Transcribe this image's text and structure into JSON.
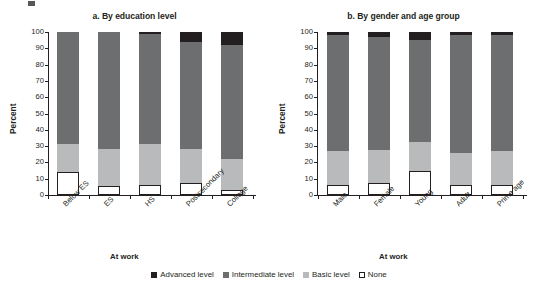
{
  "figure": {
    "ylabel": "Percent",
    "legend_title": "At work",
    "yticks": [
      0,
      10,
      20,
      30,
      40,
      50,
      60,
      70,
      80,
      90,
      100
    ]
  },
  "legend": {
    "title": "At work",
    "items": [
      {
        "label": "Advanced level",
        "color": "#231f20",
        "key": "advanced"
      },
      {
        "label": "Intermediate level",
        "color": "#6d6e70",
        "key": "intermediate"
      },
      {
        "label": "Basic level",
        "color": "#b9babc",
        "key": "basic"
      },
      {
        "label": "None",
        "color": "#ffffff",
        "key": "none"
      }
    ]
  },
  "chart_data": [
    {
      "type": "bar",
      "stacked": true,
      "title": "a. By education level",
      "xlabel": "At work",
      "ylabel": "Percent",
      "ylim": [
        0,
        100
      ],
      "yticks": [
        0,
        10,
        20,
        30,
        40,
        50,
        60,
        70,
        80,
        90,
        100
      ],
      "grid": false,
      "legend_position": "bottom",
      "categories": [
        "Below ES",
        "ES",
        "HS",
        "Postsecondary",
        "College"
      ],
      "series": [
        {
          "name": "None",
          "color": "#ffffff",
          "values": [
            14.0,
            5.5,
            6.0,
            7.5,
            3.0
          ]
        },
        {
          "name": "Basic level",
          "color": "#b9babc",
          "values": [
            17.0,
            23.0,
            25.0,
            20.5,
            19.0
          ]
        },
        {
          "name": "Intermediate level",
          "color": "#6d6e70",
          "values": [
            69.0,
            71.5,
            68.0,
            66.0,
            70.0
          ]
        },
        {
          "name": "Advanced level",
          "color": "#231f20",
          "values": [
            0.0,
            0.0,
            1.0,
            6.0,
            8.0
          ]
        }
      ]
    },
    {
      "type": "bar",
      "stacked": true,
      "title": "b. By gender and age group",
      "xlabel": "At work",
      "ylabel": "Percent",
      "ylim": [
        0,
        100
      ],
      "yticks": [
        0,
        10,
        20,
        30,
        40,
        50,
        60,
        70,
        80,
        90,
        100
      ],
      "grid": false,
      "legend_position": "bottom",
      "categories": [
        "Male",
        "Female",
        "Young",
        "Adult",
        "Prime age"
      ],
      "series": [
        {
          "name": "None",
          "color": "#ffffff",
          "values": [
            6.0,
            7.5,
            14.5,
            6.0,
            6.0
          ]
        },
        {
          "name": "Basic level",
          "color": "#b9babc",
          "values": [
            21.0,
            20.0,
            18.0,
            20.0,
            21.0
          ]
        },
        {
          "name": "Intermediate level",
          "color": "#6d6e70",
          "values": [
            71.0,
            69.5,
            62.5,
            72.0,
            71.0
          ]
        },
        {
          "name": "Advanced level",
          "color": "#231f20",
          "values": [
            2.0,
            3.0,
            5.0,
            2.0,
            2.0
          ]
        }
      ]
    }
  ]
}
